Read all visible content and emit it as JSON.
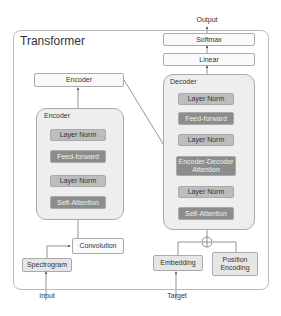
{
  "title": "Transformer",
  "input_label": "Input",
  "target_label": "Target",
  "output_label": "Output",
  "encoder": {
    "output_box": "Encoder",
    "container_label": "Encoder",
    "layers": [
      "Layer Norm",
      "Feed-forward",
      "Layer Norm",
      "Self-Attention"
    ],
    "convolution": "Convolution",
    "spectrogram": "Spectrogram"
  },
  "decoder": {
    "softmax": "Softmax",
    "linear": "Linear",
    "container_label": "Decoder",
    "layers": [
      "Layer Norm",
      "Feed-forward",
      "Layer Norm",
      "Encoder-Decoder Attention",
      "Layer Norm",
      "Self-Attention"
    ],
    "embedding": "Embedding",
    "position_encoding": "Position Encoding",
    "add_symbol": "+"
  }
}
